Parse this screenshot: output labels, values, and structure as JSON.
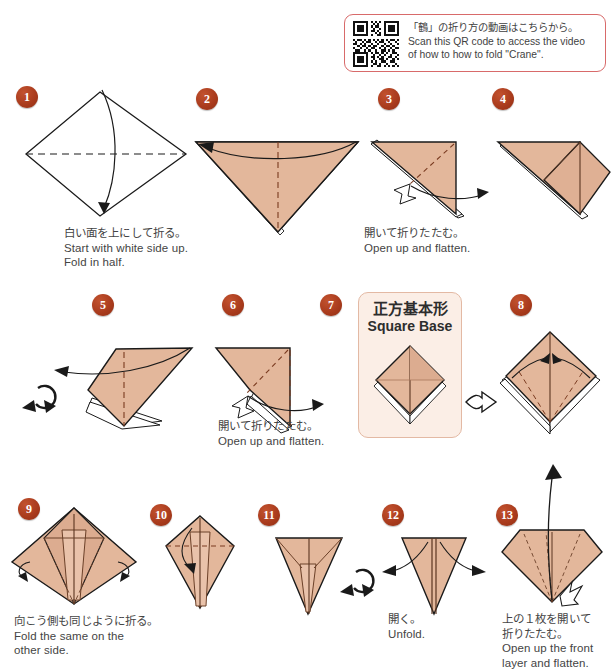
{
  "page": {
    "paper_color": "#e3b79b",
    "paper_shade_color": "#d9a98c",
    "badge_color": "#a83a1c",
    "outline_color": "#1a1a1a",
    "caption_color": "#444444"
  },
  "qr_panel": {
    "name": "qr-code-panel",
    "border_color": "#d86a6a",
    "line_jp": "「鶴」の折り方の動画はこちらから。",
    "line_en": "Scan this QR code to access the video\nof how to how to fold \"Crane\"."
  },
  "square_base_card": {
    "title_jp": "正方基本形",
    "title_en": "Square Base",
    "background": "#fbeee6",
    "border_color": "#e3b9a4"
  },
  "steps": [
    {
      "number": "1",
      "shape": "white-diamond",
      "caption": "白い面を上にして折る。\nStart with white side up.\nFold in half.",
      "symbols": [
        "valley-fold-dashed-horizontal",
        "fold-arrow-down"
      ]
    },
    {
      "number": "2",
      "shape": "down-triangle",
      "caption": "",
      "symbols": [
        "valley-fold-dashed-vertical",
        "fold-arrow-left"
      ]
    },
    {
      "number": "3",
      "shape": "layered-right-triangle",
      "caption": "開いて折りたたむ。\nOpen up and flatten.",
      "symbols": [
        "fold-dashed-diagonal",
        "open-flatten-arrow-right",
        "insert-symbol"
      ]
    },
    {
      "number": "4",
      "shape": "opened-flap",
      "caption": "",
      "symbols": []
    },
    {
      "number": "5",
      "shape": "opened-flap-wide",
      "caption": "",
      "symbols": [
        "valley-fold-dashed-vertical",
        "pull-arrow-left",
        "turn-over-symbol"
      ]
    },
    {
      "number": "6",
      "shape": "layered-triangle-left",
      "caption": "開いて折りたたむ。\nOpen up and flatten.",
      "symbols": [
        "fold-dashed-diagonal",
        "open-flatten-arrow-right",
        "insert-symbol"
      ]
    },
    {
      "number": "7",
      "shape": "square-base-diamond",
      "caption": "",
      "symbols": []
    },
    {
      "number": "8",
      "shape": "square-base-diamond-open",
      "caption": "",
      "symbols": [
        "fold-dashed-slanted-pair",
        "fold-arrows-inward",
        "hollow-arrow-right"
      ]
    },
    {
      "number": "9",
      "shape": "kite-folded",
      "caption": "向こう側も同じように折る。\nFold the same on the\nother side.",
      "symbols": [
        "fold-behind-arrow-left",
        "fold-behind-arrow-right"
      ]
    },
    {
      "number": "10",
      "shape": "narrow-kite",
      "caption": "",
      "symbols": [
        "valley-fold-dashed-horizontal",
        "fold-arrow-down"
      ]
    },
    {
      "number": "11",
      "shape": "down-triangle-narrow",
      "caption": "",
      "symbols": [
        "turn-over-symbol"
      ]
    },
    {
      "number": "12",
      "shape": "down-triangle-split",
      "caption": "開く。\nUnfold.",
      "symbols": [
        "unfold-arrow-left",
        "unfold-arrow-right"
      ]
    },
    {
      "number": "13",
      "shape": "fan-gem",
      "caption": "上の１枚を開いて\n折りたたむ。\nOpen up the front\nlayer and flatten.",
      "symbols": [
        "fold-dashed-lines",
        "open-arrow-up",
        "insert-symbol"
      ]
    }
  ]
}
